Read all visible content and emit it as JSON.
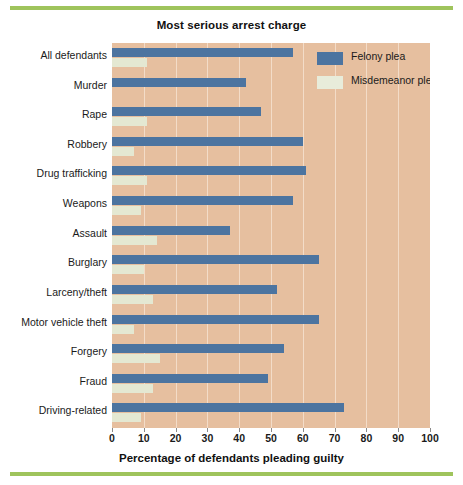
{
  "chart_data": {
    "type": "bar",
    "orientation": "horizontal",
    "title": "Most serious arrest charge",
    "xlabel": "Percentage of defendants pleading guilty",
    "ylabel": "",
    "xlim": [
      0,
      100
    ],
    "xticks": [
      0,
      10,
      20,
      30,
      40,
      50,
      60,
      70,
      80,
      90,
      100
    ],
    "grid": true,
    "grid_axis": "x",
    "legend_position": "upper right inside plot",
    "categories": [
      "All defendants",
      "Murder",
      "Rape",
      "Robbery",
      "Drug trafficking",
      "Weapons",
      "Assault",
      "Burglary",
      "Larceny/theft",
      "Motor vehicle theft",
      "Forgery",
      "Fraud",
      "Driving-related"
    ],
    "series": [
      {
        "name": "Felony plea",
        "color": "#4c74a0",
        "values": [
          57,
          42,
          47,
          60,
          61,
          57,
          37,
          65,
          52,
          65,
          54,
          49,
          73
        ]
      },
      {
        "name": "Misdemeanor plea",
        "color": "#e4e8d2",
        "values": [
          11,
          0,
          11,
          7,
          11,
          9,
          14,
          10,
          13,
          7,
          15,
          13,
          9
        ]
      }
    ]
  },
  "colors": {
    "plot_background": "#e6bf9f",
    "gridline": "#f3dcc8",
    "felony": "#4c74a0",
    "misdemeanor": "#e4e8d2",
    "accent_rule": "#9fc45c",
    "text": "#1a1a1a"
  }
}
